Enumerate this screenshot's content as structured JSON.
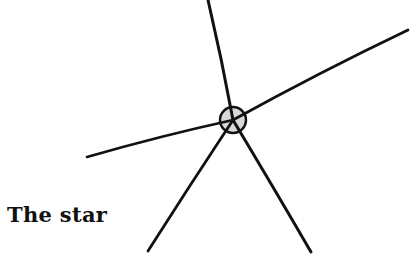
{
  "figure": {
    "caption": "The star",
    "center": {
      "x": 233,
      "y": 120,
      "radius": 13
    },
    "center_fill": "#d8d8d8",
    "stroke_color": "#111111",
    "rays": [
      {
        "name": "top",
        "x1": 208,
        "y1": 0,
        "x2": 233,
        "y2": 120
      },
      {
        "name": "upper-right",
        "x1": 233,
        "y1": 120,
        "x2": 408,
        "y2": 30
      },
      {
        "name": "left",
        "x1": 87,
        "y1": 157,
        "x2": 233,
        "y2": 120
      },
      {
        "name": "lower-left",
        "x1": 233,
        "y1": 120,
        "x2": 148,
        "y2": 251
      },
      {
        "name": "lower-right",
        "x1": 233,
        "y1": 120,
        "x2": 311,
        "y2": 252
      }
    ]
  }
}
